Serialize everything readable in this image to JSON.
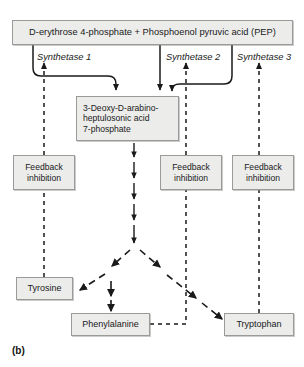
{
  "figure": {
    "label": "(b)",
    "caption_letter": "(b)"
  },
  "nodes": {
    "substrate": "D-erythrose 4-phosphate + Phosphoenol pyruvic acid (PEP)",
    "dahp": "3-Deoxy-D-arabino-\nheptulosonic acid\n7-phosphate",
    "feedback_1": "Feedback\ninhibition",
    "feedback_2": "Feedback\ninhibition",
    "feedback_3": "Feedback\ninhibition",
    "tyrosine": "Tyrosine",
    "phenylalanine": "Phenylalanine",
    "tryptophan": "Tryptophan"
  },
  "enzymes": {
    "synthetase_1": "Synthetase 1",
    "synthetase_2": "Synthetase 2",
    "synthetase_3": "Synthetase 3"
  },
  "colors": {
    "box_fill": "#ececeb",
    "box_border": "#9a9a98",
    "line": "#1a1a1a",
    "text": "#1a1a1a",
    "background": "#ffffff"
  }
}
